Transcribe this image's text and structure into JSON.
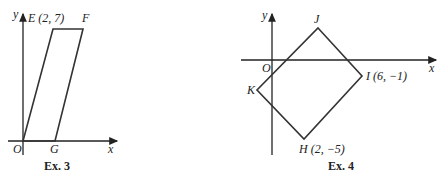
{
  "figures": [
    {
      "caption": "Ex. 3",
      "axes": {
        "x_label": "x",
        "y_label": "y",
        "origin_label": "O"
      },
      "shape": "parallelogram",
      "vertices": [
        {
          "name": "O",
          "label": "O",
          "coords": [
            0,
            0
          ]
        },
        {
          "name": "E",
          "label": "E (2, 7)",
          "coords": [
            2,
            7
          ]
        },
        {
          "name": "F",
          "label": "F"
        },
        {
          "name": "G",
          "label": "G"
        }
      ]
    },
    {
      "caption": "Ex. 4",
      "axes": {
        "x_label": "x",
        "y_label": "y",
        "origin_label": "O"
      },
      "shape": "rectangle",
      "vertices": [
        {
          "name": "J",
          "label": "J"
        },
        {
          "name": "I",
          "label": "I (6, −1)",
          "coords": [
            6,
            -1
          ]
        },
        {
          "name": "H",
          "label": "H (2, −5)",
          "coords": [
            2,
            -5
          ]
        },
        {
          "name": "K",
          "label": "K"
        }
      ]
    }
  ]
}
